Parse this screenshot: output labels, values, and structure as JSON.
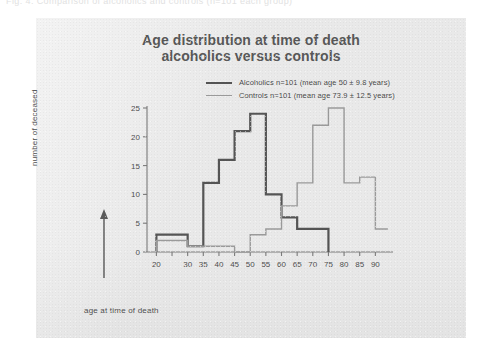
{
  "scan": {
    "top_caption_fragment": "Fig.   4.   Comparison of alcoholics and controls (n=101 each group)"
  },
  "chart": {
    "title_line1": "Age distribution at time of death",
    "title_line2": "alcoholics versus controls",
    "xlabel": "age at time of death",
    "ylabel": "number of deceased",
    "legend": [
      {
        "label": "Alcoholics n=101 (mean age 50 ± 9.8 years)",
        "color": "#555555",
        "style": "thick"
      },
      {
        "label": "Controls n=101 (mean age 73.9 ± 12.5 years)",
        "color": "#9a9a9a",
        "style": "thin"
      }
    ]
  },
  "chart_data": {
    "type": "line",
    "subtype": "step-histogram-outline",
    "title": "Age distribution at time of death alcoholics versus controls",
    "xlabel": "age at time of death",
    "ylabel": "number of deceased",
    "xlim": [
      17,
      95
    ],
    "ylim": [
      0,
      25
    ],
    "grid": false,
    "legend_position": "top-right",
    "x_ticks": [
      20,
      25,
      30,
      35,
      40,
      45,
      50,
      55,
      60,
      65,
      70,
      75,
      80,
      85,
      90
    ],
    "x_tick_labels": [
      "20",
      "",
      "30",
      "35",
      "40",
      "45",
      "50",
      "55",
      "60",
      "65",
      "70",
      "75",
      "80",
      "85",
      "90"
    ],
    "y_ticks": [
      0,
      5,
      10,
      15,
      20,
      25
    ],
    "y_tick_labels": [
      "0",
      "5",
      "10",
      "15",
      "20",
      "25"
    ],
    "series": [
      {
        "name": "Alcoholics n=101 (mean age 50 ± 9.8 years)",
        "color": "#555555",
        "line_width": 2.2,
        "mean_age": 50,
        "sd": 9.8,
        "n": 101,
        "bins": [
          {
            "x0": 20,
            "x1": 30,
            "value": 3
          },
          {
            "x0": 30,
            "x1": 35,
            "value": 1
          },
          {
            "x0": 35,
            "x1": 40,
            "value": 12
          },
          {
            "x0": 40,
            "x1": 45,
            "value": 16
          },
          {
            "x0": 45,
            "x1": 50,
            "value": 21
          },
          {
            "x0": 50,
            "x1": 55,
            "value": 24
          },
          {
            "x0": 55,
            "x1": 60,
            "value": 10
          },
          {
            "x0": 60,
            "x1": 65,
            "value": 6
          },
          {
            "x0": 65,
            "x1": 75,
            "value": 4
          }
        ]
      },
      {
        "name": "Controls n=101 (mean age 73.9 ± 12.5 years)",
        "color": "#9a9a9a",
        "line_width": 1.4,
        "mean_age": 73.9,
        "sd": 12.5,
        "n": 101,
        "bins": [
          {
            "x0": 20,
            "x1": 30,
            "value": 2
          },
          {
            "x0": 30,
            "x1": 45,
            "value": 1
          },
          {
            "x0": 45,
            "x1": 50,
            "value": 0
          },
          {
            "x0": 50,
            "x1": 55,
            "value": 3
          },
          {
            "x0": 55,
            "x1": 60,
            "value": 4
          },
          {
            "x0": 60,
            "x1": 65,
            "value": 8
          },
          {
            "x0": 65,
            "x1": 70,
            "value": 12
          },
          {
            "x0": 70,
            "x1": 75,
            "value": 22
          },
          {
            "x0": 75,
            "x1": 80,
            "value": 25
          },
          {
            "x0": 80,
            "x1": 85,
            "value": 12
          },
          {
            "x0": 85,
            "x1": 90,
            "value": 13
          },
          {
            "x0": 90,
            "x1": 94,
            "value": 4
          }
        ]
      }
    ]
  }
}
